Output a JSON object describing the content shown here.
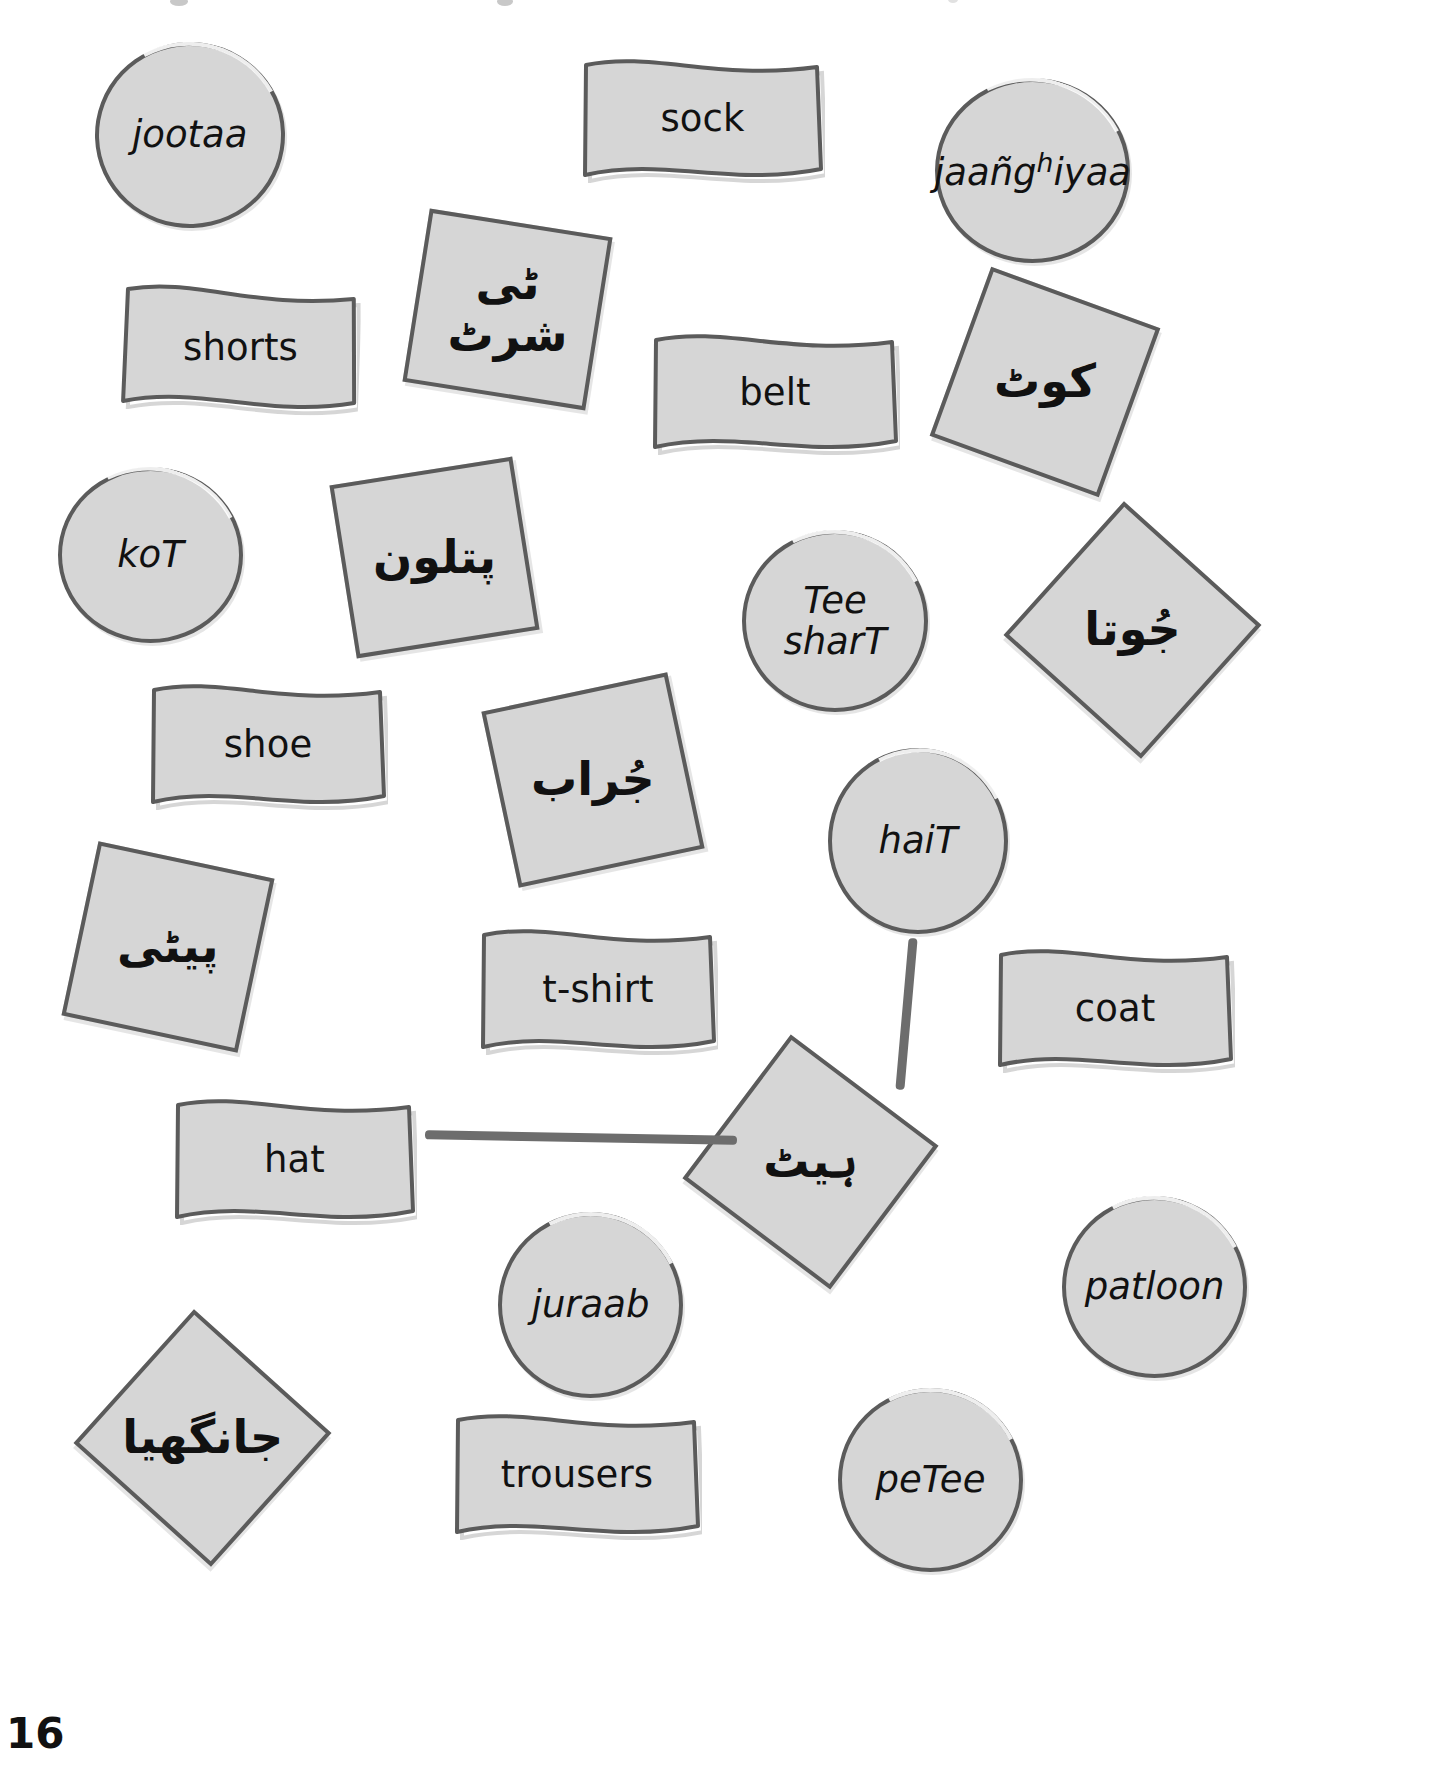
{
  "page": {
    "number": "16",
    "background_color": "#ffffff",
    "card_fill": "#d6d6d6",
    "card_stroke": "#5b5b5b",
    "connector_color": "#6d6d6d"
  },
  "cards": [
    {
      "id": "jootaa-circle",
      "label": "jootaa",
      "script": "roman",
      "shape": "circle",
      "x": 95,
      "y": 42,
      "w": 190,
      "h": 186,
      "rot": -2
    },
    {
      "id": "sock-flag",
      "label": "sock",
      "script": "english",
      "shape": "flag",
      "x": 580,
      "y": 55,
      "w": 245,
      "h": 128,
      "rot": 0
    },
    {
      "id": "jaanghiyaa-circle",
      "label": "jaañg",
      "label_sup": "h",
      "label_tail": "iyaa",
      "script": "roman",
      "shape": "circle",
      "x": 935,
      "y": 78,
      "w": 195,
      "h": 185,
      "rot": 0
    },
    {
      "id": "shorts-flag",
      "label": "shorts",
      "script": "english",
      "shape": "flag",
      "x": 120,
      "y": 283,
      "w": 240,
      "h": 130,
      "rot": 2
    },
    {
      "id": "tee-shart-urdu",
      "label": "ٹی شرٹ",
      "script": "urdu",
      "shape": "square",
      "x": 415,
      "y": 222,
      "w": 185,
      "h": 175,
      "rot": 9
    },
    {
      "id": "belt-flag",
      "label": "belt",
      "script": "english",
      "shape": "flag",
      "x": 650,
      "y": 330,
      "w": 250,
      "h": 125,
      "rot": 0
    },
    {
      "id": "kot-urdu",
      "label": "کوٹ",
      "script": "urdu",
      "shape": "square",
      "x": 955,
      "y": 292,
      "w": 180,
      "h": 180,
      "rot": 20
    },
    {
      "id": "kot-circle",
      "label": "koT",
      "script": "roman",
      "shape": "circle",
      "x": 58,
      "y": 467,
      "w": 185,
      "h": 176,
      "rot": 0
    },
    {
      "id": "patloon-urdu",
      "label": "پتلون",
      "script": "urdu",
      "shape": "square",
      "x": 342,
      "y": 470,
      "w": 185,
      "h": 175,
      "rot": -9
    },
    {
      "id": "tee-shart-circle",
      "label": "Tee sharT",
      "script": "roman",
      "shape": "circle",
      "x": 742,
      "y": 530,
      "w": 186,
      "h": 182,
      "rot": 0
    },
    {
      "id": "jootaa-urdu",
      "label": "جُوتا",
      "script": "urdu",
      "shape": "square",
      "x": 1040,
      "y": 540,
      "w": 185,
      "h": 180,
      "rot": 42
    },
    {
      "id": "shoe-flag",
      "label": "shoe",
      "script": "english",
      "shape": "flag",
      "x": 148,
      "y": 680,
      "w": 240,
      "h": 130,
      "rot": 0
    },
    {
      "id": "juraab-urdu",
      "label": "جُراب",
      "script": "urdu",
      "shape": "square",
      "x": 498,
      "y": 690,
      "w": 190,
      "h": 180,
      "rot": -12
    },
    {
      "id": "hait-circle",
      "label": "haiT",
      "script": "roman",
      "shape": "circle",
      "x": 828,
      "y": 748,
      "w": 180,
      "h": 186,
      "rot": 0
    },
    {
      "id": "petee-urdu",
      "label": "پیٹی",
      "script": "urdu",
      "shape": "square",
      "x": 78,
      "y": 858,
      "w": 180,
      "h": 178,
      "rot": 12
    },
    {
      "id": "tshirt-flag",
      "label": "t-shirt",
      "script": "english",
      "shape": "flag",
      "x": 478,
      "y": 925,
      "w": 240,
      "h": 130,
      "rot": 0
    },
    {
      "id": "coat-flag",
      "label": "coat",
      "script": "english",
      "shape": "flag",
      "x": 995,
      "y": 945,
      "w": 240,
      "h": 128,
      "rot": 0
    },
    {
      "id": "hat-flag",
      "label": "hat",
      "script": "english",
      "shape": "flag",
      "x": 172,
      "y": 1095,
      "w": 245,
      "h": 130,
      "rot": 0
    },
    {
      "id": "hait-urdu",
      "label": "ہیٹ",
      "script": "urdu",
      "shape": "square",
      "x": 718,
      "y": 1072,
      "w": 185,
      "h": 180,
      "rot": 37
    },
    {
      "id": "patloon-circle",
      "label": "patloon",
      "script": "roman",
      "shape": "circle",
      "x": 1062,
      "y": 1196,
      "w": 185,
      "h": 182,
      "rot": 0
    },
    {
      "id": "juraab-circle",
      "label": "juraab",
      "script": "roman",
      "shape": "circle",
      "x": 498,
      "y": 1212,
      "w": 185,
      "h": 186,
      "rot": 0
    },
    {
      "id": "jaanghiyaa-urdu",
      "label": "جانگھیا",
      "script": "urdu",
      "shape": "square",
      "x": 110,
      "y": 1348,
      "w": 185,
      "h": 180,
      "rot": 42
    },
    {
      "id": "trousers-flag",
      "label": "trousers",
      "script": "english",
      "shape": "flag",
      "x": 452,
      "y": 1410,
      "w": 250,
      "h": 130,
      "rot": 0
    },
    {
      "id": "petee-circle",
      "label": "peTee",
      "script": "roman",
      "shape": "circle",
      "x": 838,
      "y": 1388,
      "w": 185,
      "h": 184,
      "rot": 0
    }
  ],
  "connectors": [
    {
      "id": "hat-to-hait-urdu",
      "from": "hat-flag",
      "to": "hait-urdu",
      "x": 425,
      "y": 1133,
      "w": 312,
      "h": 9,
      "rot": 1
    },
    {
      "id": "hait-circle-to-hait-urdu",
      "from": "hait-circle",
      "to": "hait-urdu",
      "x": 902,
      "y": 938,
      "w": 9,
      "h": 152,
      "rot": 5
    }
  ]
}
